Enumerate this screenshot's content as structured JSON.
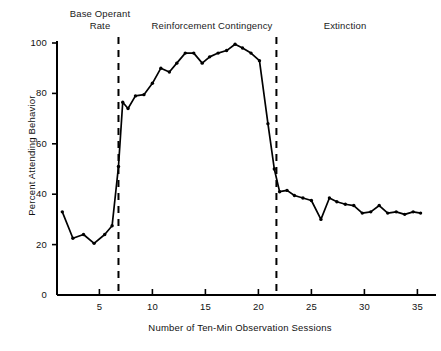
{
  "chart_data": {
    "type": "line",
    "title": "",
    "xlabel": "Number of Ten-Min Observation Sessions",
    "ylabel": "Percent Attending Behavior",
    "xlim": [
      1,
      36
    ],
    "ylim": [
      0,
      100
    ],
    "grid": false,
    "legend": "none",
    "xticks": [
      5,
      10,
      15,
      20,
      25,
      30,
      35
    ],
    "yticks": [
      0,
      20,
      40,
      60,
      80,
      100
    ],
    "xtick_labels": [
      "5",
      "10",
      "15",
      "20",
      "25",
      "30",
      "35"
    ],
    "ytick_labels": [
      "0",
      "20",
      "40",
      "60",
      "80",
      "100"
    ],
    "markers": "filled-dot",
    "line_color": "#000000",
    "series": [
      {
        "name": "Percent Attending Behavior",
        "x": [
          1.5,
          2.5,
          3.5,
          4.5,
          5.5,
          6.2,
          6.8,
          7.2,
          7.7,
          8.4,
          9.2,
          10.0,
          10.8,
          11.6,
          12.3,
          13.1,
          13.9,
          14.7,
          15.4,
          16.2,
          17.0,
          17.8,
          18.5,
          19.3,
          20.1,
          20.9,
          21.5,
          22.0,
          22.7,
          23.4,
          24.2,
          25.0,
          25.9,
          26.7,
          27.4,
          28.2,
          29.0,
          29.8,
          30.6,
          31.4,
          32.2,
          33.0,
          33.8,
          34.6,
          35.3
        ],
        "values": [
          33,
          22.5,
          24,
          20.5,
          24,
          27.5,
          51,
          76.5,
          74,
          79,
          79.5,
          84,
          90,
          88.5,
          92,
          96,
          96,
          92,
          94.5,
          96,
          97,
          99.5,
          98,
          96,
          93,
          68,
          50,
          41,
          41.5,
          39.5,
          38.5,
          37.5,
          30,
          38.5,
          37,
          36,
          35.5,
          32.5,
          33,
          35.5,
          32.5,
          33,
          32,
          33,
          32.5
        ]
      }
    ],
    "phases": [
      {
        "id": "base-operant-rate",
        "label": "Base Operant\nRate",
        "start": 1,
        "end": 6.8
      },
      {
        "id": "reinforcement-contingency",
        "label": "Reinforcement Contingency",
        "start": 6.8,
        "end": 21.7
      },
      {
        "id": "extinction",
        "label": "Extinction",
        "start": 21.7,
        "end": 36
      }
    ],
    "phase_dividers": [
      {
        "x": 6.8,
        "style": "dashed"
      },
      {
        "x": 21.7,
        "style": "dashed"
      }
    ]
  }
}
